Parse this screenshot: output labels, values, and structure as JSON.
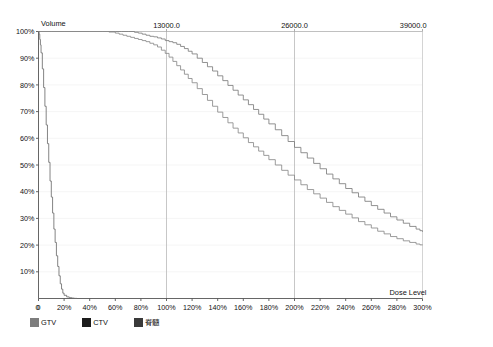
{
  "chart_data": {
    "type": "line",
    "title": "",
    "xlabel": "Dose Level",
    "ylabel": "Volume",
    "xlim": [
      0,
      300
    ],
    "ylim": [
      0,
      100
    ],
    "grid": true,
    "gridlines_x": [
      100,
      200
    ],
    "legend_position": "bottom-left",
    "x_tick_labels": [
      "0",
      "20%",
      "40%",
      "60%",
      "80%",
      "100%",
      "120%",
      "140%",
      "160%",
      "180%",
      "200%",
      "220%",
      "240%",
      "260%",
      "280%",
      "300%"
    ],
    "x_tick_values": [
      0,
      20,
      40,
      60,
      80,
      100,
      120,
      140,
      160,
      180,
      200,
      220,
      240,
      260,
      280,
      300
    ],
    "y_tick_labels": [
      "10%",
      "20%",
      "30%",
      "40%",
      "50%",
      "60%",
      "70%",
      "80%",
      "90%",
      "100%"
    ],
    "y_tick_values": [
      10,
      20,
      30,
      40,
      50,
      60,
      70,
      80,
      90,
      100
    ],
    "secondary_axis": {
      "position": "top",
      "label": "",
      "tick_labels": [
        "13000.0",
        "26000.0",
        "39000.0"
      ],
      "tick_values": [
        100,
        200,
        300
      ]
    },
    "series": [
      {
        "name": "GTV",
        "color": "#7d7d7d",
        "x": [
          0,
          5,
          10,
          20,
          30,
          40,
          50,
          60,
          65,
          70,
          75,
          78,
          81,
          84,
          87,
          90,
          93,
          96,
          99,
          102,
          105,
          108,
          111,
          114,
          117,
          120,
          124,
          128,
          132,
          136,
          140,
          144,
          148,
          152,
          156,
          160,
          164,
          168,
          172,
          176,
          180,
          185,
          190,
          195,
          200,
          205,
          210,
          215,
          220,
          225,
          230,
          235,
          240,
          245,
          250,
          255,
          260,
          265,
          270,
          275,
          280,
          285,
          290,
          295,
          298,
          300
        ],
        "y": [
          100,
          100,
          100,
          100,
          100,
          100,
          100,
          100,
          100,
          100,
          99.7,
          99.4,
          99.0,
          98.6,
          98.2,
          98.0,
          97.6,
          97.2,
          96.6,
          96.2,
          95.8,
          95.2,
          94.4,
          93.6,
          92.6,
          91.6,
          90.0,
          88.4,
          86.8,
          85.2,
          83.4,
          81.6,
          79.8,
          78.0,
          76.2,
          74.4,
          72.6,
          70.8,
          69.0,
          67.2,
          65.4,
          63.2,
          61.0,
          58.8,
          56.6,
          54.6,
          52.6,
          50.6,
          48.6,
          46.6,
          44.8,
          43.0,
          41.2,
          39.6,
          38.0,
          36.4,
          34.8,
          33.4,
          32.0,
          30.6,
          29.4,
          28.2,
          27.0,
          26.0,
          25.4,
          25.0
        ]
      },
      {
        "name": "CTV",
        "color": "#8a8a8a",
        "x": [
          0,
          5,
          10,
          20,
          30,
          40,
          50,
          55,
          60,
          63,
          66,
          69,
          72,
          75,
          78,
          81,
          84,
          87,
          90,
          93,
          96,
          99,
          102,
          105,
          108,
          111,
          114,
          117,
          120,
          124,
          128,
          132,
          136,
          140,
          144,
          148,
          152,
          156,
          160,
          164,
          168,
          172,
          176,
          180,
          185,
          190,
          195,
          200,
          205,
          210,
          215,
          220,
          225,
          230,
          235,
          240,
          245,
          250,
          255,
          260,
          265,
          270,
          275,
          280,
          285,
          290,
          295,
          298,
          300
        ],
        "y": [
          100,
          100,
          100,
          100,
          100,
          100,
          100,
          99.8,
          99.4,
          99.0,
          98.6,
          98.2,
          97.8,
          97.4,
          97.0,
          96.6,
          96.2,
          95.6,
          95.0,
          94.2,
          93.0,
          91.8,
          90.4,
          88.8,
          87.2,
          85.6,
          84.0,
          82.4,
          80.8,
          78.6,
          76.4,
          74.2,
          72.0,
          69.8,
          67.8,
          65.8,
          63.8,
          62.0,
          60.2,
          58.4,
          56.8,
          55.2,
          53.6,
          52.0,
          50.0,
          48.0,
          46.2,
          44.4,
          42.6,
          40.8,
          39.2,
          37.6,
          36.0,
          34.4,
          33.0,
          31.6,
          30.2,
          28.8,
          27.6,
          26.4,
          25.2,
          24.2,
          23.2,
          22.4,
          21.6,
          21.0,
          20.4,
          20.1,
          20.0
        ]
      },
      {
        "name": "脊髓",
        "color": "#6e6e6e",
        "x": [
          0,
          0.5,
          1,
          1.5,
          2,
          3,
          4,
          5,
          6,
          7,
          8,
          9,
          10,
          11,
          12,
          13,
          14,
          15,
          16,
          17,
          18,
          19,
          20,
          22,
          24,
          26,
          28,
          30
        ],
        "y": [
          100,
          99,
          97,
          95,
          92,
          86,
          79,
          72,
          65,
          58,
          51,
          44,
          38,
          32,
          26,
          21,
          16,
          12,
          8.5,
          5.5,
          3.5,
          2.0,
          1.2,
          0.6,
          0.3,
          0.15,
          0.05,
          0
        ]
      }
    ]
  },
  "axes": {
    "y_title": "Volume",
    "x_title": "Dose Level",
    "origin_label": "0"
  },
  "legend": {
    "items": [
      {
        "label": "GTV",
        "color": "#7d7d7d"
      },
      {
        "label": "CTV",
        "color": "#1c1c1c"
      },
      {
        "label": "脊髓",
        "color": "#3a3a3a"
      }
    ]
  }
}
